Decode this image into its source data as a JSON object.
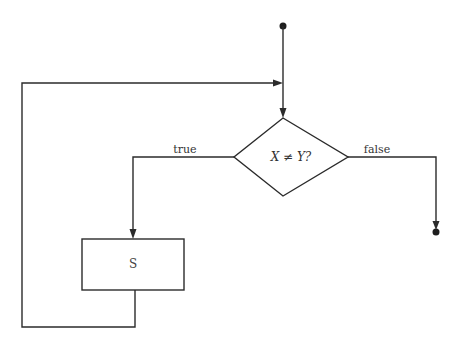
{
  "diagram": {
    "type": "flowchart",
    "decision": {
      "label": "X ≠ Y?"
    },
    "statement": {
      "label": "S"
    },
    "branches": {
      "true_label": "true",
      "false_label": "false"
    },
    "nodes": [
      {
        "id": "start",
        "kind": "terminal-dot"
      },
      {
        "id": "decision",
        "kind": "diamond",
        "label": "X ≠ Y?"
      },
      {
        "id": "statement",
        "kind": "rectangle",
        "label": "S"
      },
      {
        "id": "end",
        "kind": "terminal-dot"
      }
    ],
    "edges": [
      {
        "from": "start",
        "to": "decision"
      },
      {
        "from": "decision",
        "to": "statement",
        "label": "true"
      },
      {
        "from": "statement",
        "to": "decision",
        "label": "loop-back"
      },
      {
        "from": "decision",
        "to": "end",
        "label": "false"
      }
    ],
    "colors": {
      "line": "#2b2b2b",
      "background": "#ffffff"
    }
  }
}
